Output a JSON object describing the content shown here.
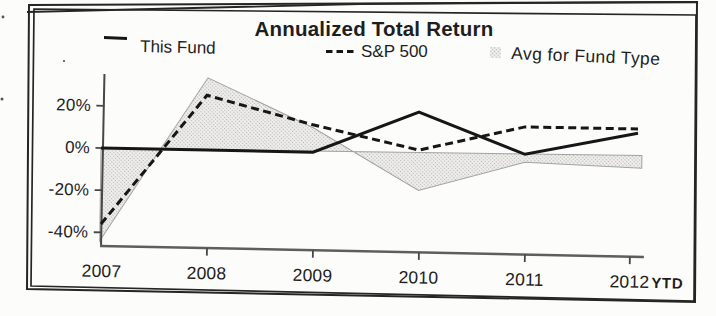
{
  "title": "Annualized Total Return",
  "legend": {
    "this_fund": "This Fund",
    "sp500": "S&P 500",
    "avg": "Avg for Fund Type"
  },
  "x_axis": {
    "labels": [
      "2007",
      "2008",
      "2009",
      "2010",
      "2011",
      "2012"
    ],
    "suffix": "YTD"
  },
  "y_axis": {
    "labels": [
      "20%",
      "0%",
      "-20%",
      "-40%"
    ]
  },
  "chart_data": {
    "type": "line",
    "title": "Annualized Total Return",
    "categories": [
      "2007",
      "2008",
      "2009",
      "2010",
      "2011",
      "2012 YTD"
    ],
    "series": [
      {
        "name": "This Fund",
        "style": "solid_line",
        "values": [
          0,
          -1,
          -2,
          17,
          -3,
          7
        ]
      },
      {
        "name": "S&P 500",
        "style": "dashed_line",
        "values": [
          -36,
          25,
          11,
          -1,
          10,
          9
        ]
      },
      {
        "name": "Avg for Fund Type",
        "style": "shaded_area",
        "values": [
          -44,
          34,
          11,
          -18,
          -4,
          -6
        ]
      }
    ],
    "xlabel": "",
    "ylabel": "",
    "y_ticks_percent": [
      20,
      0,
      -20,
      -40
    ],
    "ylim": [
      -47,
      36
    ],
    "grid": false,
    "legend_position": "top",
    "area_baseline_percent": 0
  },
  "colors": {
    "background": "#fcfcfb",
    "text": "#1e1e1e",
    "frame": "#252525",
    "line": "#161616",
    "axis": "#474747",
    "axis_x": "#5e5e5e",
    "area_bg": "#f0efed",
    "area_dot": "#b5b5b1",
    "area_edge": "#a3a3a0"
  }
}
